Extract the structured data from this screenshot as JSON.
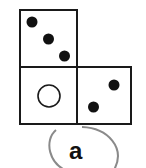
{
  "diagram": {
    "type": "dice-net-fragment",
    "faces": [
      {
        "id": "top",
        "position": "top-left",
        "symbol": "dots",
        "count": 3,
        "arrangement": "diagonal"
      },
      {
        "id": "bottom-left",
        "position": "bottom-left",
        "symbol": "hollow-circle",
        "count": 1
      },
      {
        "id": "bottom-right",
        "position": "bottom-right",
        "symbol": "dots",
        "count": 2,
        "arrangement": "diagonal"
      }
    ],
    "option_label": "a",
    "colors": {
      "stroke": "#1a1a1a",
      "dot": "#111111",
      "ellipse": "#8a8a8a",
      "background": "#ffffff"
    }
  }
}
